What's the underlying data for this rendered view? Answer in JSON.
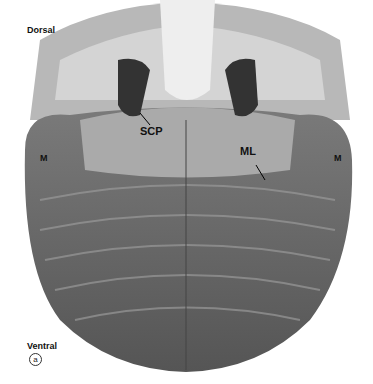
{
  "figure": {
    "panel_letter": "a",
    "orientation": {
      "top": "Dorsal",
      "bottom": "Ventral"
    },
    "labels": {
      "scp": "SCP",
      "ml": "ML",
      "m_left": "M",
      "m_right": "M"
    }
  }
}
